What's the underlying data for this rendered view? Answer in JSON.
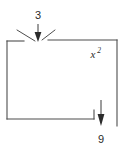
{
  "figure": {
    "type": "geometry-diagram",
    "background_color": "#ffffff",
    "stroke_color": "#4d4d4d",
    "text_color": "#2b2b2b",
    "shape": {
      "name": "rectangle-with-notch",
      "description": "Rectangle outline with a gap in the top edge and a small step notch in the bottom right edge"
    },
    "labels": {
      "top_dimension": "3",
      "area_label_base": "x",
      "area_label_exponent": "2",
      "bottom_dimension": "9"
    },
    "annotations": [
      {
        "name": "top-arrow",
        "label": "3",
        "direction": "down",
        "points_to": "gap in top edge"
      },
      {
        "name": "bottom-arrow",
        "label": "9",
        "direction": "down",
        "points_to": "notch in bottom right edge"
      },
      {
        "name": "area-label",
        "label": "x²",
        "position": "inside upper right"
      }
    ]
  }
}
